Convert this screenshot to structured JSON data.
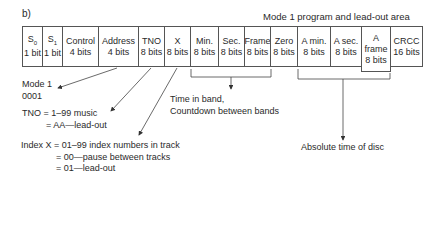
{
  "figure_label": "b)",
  "area_title": "Mode 1 program and lead-out area",
  "fields": [
    {
      "name": "S",
      "sub": "0",
      "size": "1 bit",
      "x": 22,
      "w": 21
    },
    {
      "name": "S",
      "sub": "1",
      "size": "1 bit",
      "x": 42,
      "w": 21
    },
    {
      "name": "Control",
      "sub": "",
      "size": "4 bits",
      "x": 62,
      "w": 37
    },
    {
      "name": "Address",
      "sub": "",
      "size": "4 bits",
      "x": 98,
      "w": 41
    },
    {
      "name": "TNO",
      "sub": "",
      "size": "8 bits",
      "x": 138,
      "w": 27
    },
    {
      "name": "X",
      "sub": "",
      "size": "8 bits",
      "x": 164,
      "w": 27
    },
    {
      "name": "Min.",
      "sub": "",
      "size": "8 bits",
      "x": 190,
      "w": 29
    },
    {
      "name": "Sec.",
      "sub": "",
      "size": "8 bits",
      "x": 218,
      "w": 27
    },
    {
      "name": "Frame",
      "sub": "",
      "size": "8 bits",
      "x": 244,
      "w": 27
    },
    {
      "name": "Zero",
      "sub": "",
      "size": "8 bits",
      "x": 270,
      "w": 28
    },
    {
      "name": "A min.",
      "sub": "",
      "size": "8 bits",
      "x": 297,
      "w": 34
    },
    {
      "name": "A sec.",
      "sub": "",
      "size": "8 bits",
      "x": 330,
      "w": 32
    },
    {
      "name": "A frame",
      "sub": "",
      "size": "8 bits",
      "x": 361,
      "w": 30,
      "tall": true
    },
    {
      "name": "CRCC",
      "sub": "",
      "size": "16 bits",
      "x": 390,
      "w": 33
    }
  ],
  "notes": {
    "mode": [
      "Mode 1",
      "0001"
    ],
    "tno": [
      "TNO = 1–99 music",
      "= AA—lead-out"
    ],
    "index": [
      "Index X = 01–99 index numbers in track",
      "= 00—pause between tracks",
      "= 01—lead-out"
    ],
    "time_in_band": [
      "Time in band,",
      "Countdown between bands"
    ],
    "absolute_time": "Absolute time of disc"
  }
}
